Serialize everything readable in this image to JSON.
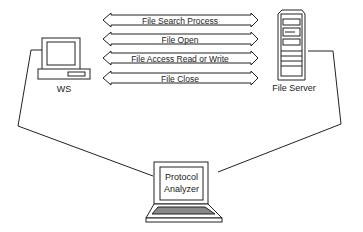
{
  "diagram": {
    "nodes": {
      "workstation": {
        "label": "WS",
        "icon": "desktop-computer-icon"
      },
      "server": {
        "label": "File Server",
        "icon": "tower-server-icon"
      },
      "analyzer": {
        "label_line1": "Protocol",
        "label_line2": "Analyzer",
        "icon": "laptop-icon"
      }
    },
    "messages": [
      {
        "label": "File Search Process",
        "direction": "bidirectional"
      },
      {
        "label": "File Open",
        "direction": "bidirectional"
      },
      {
        "label": "File Access Read or Write",
        "direction": "bidirectional"
      },
      {
        "label": "File Close",
        "direction": "bidirectional"
      }
    ],
    "connections": [
      {
        "from": "workstation",
        "to": "analyzer"
      },
      {
        "from": "server",
        "to": "analyzer"
      }
    ],
    "colors": {
      "stroke": "#222222",
      "background": "#ffffff",
      "fill": "#ffffff"
    }
  }
}
